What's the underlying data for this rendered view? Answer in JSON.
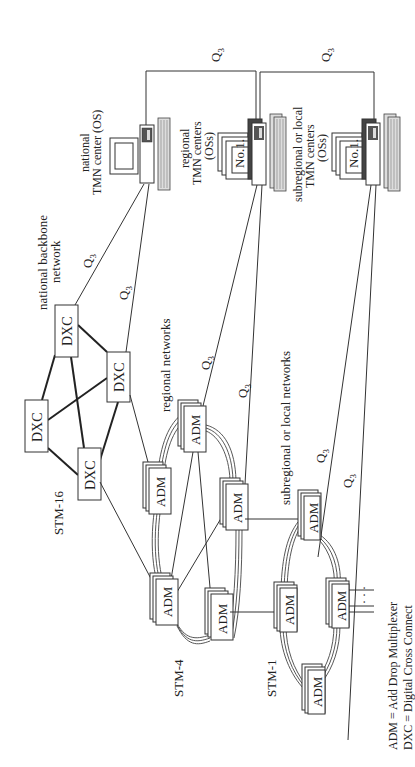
{
  "diagram": {
    "orientation": "rotated 90 degrees counter-clockwise",
    "management_link_label": "Q3",
    "q3_label_main": "Q",
    "q3_label_sub": "3",
    "tmn_centers": {
      "national": {
        "line1": "national",
        "line2": "TMN center (OS)"
      },
      "regional": {
        "line1": "regional",
        "line2": "TMN centers",
        "line3": "(OSs)",
        "screen_label": "No.1."
      },
      "subregional": {
        "line1": "subregional or local",
        "line2": "TMN centers",
        "line3": "(OSs)",
        "screen_label": "No.1."
      }
    },
    "network_labels": {
      "backbone_line1": "national backbone",
      "backbone_line2": "network",
      "regional": "regional networks",
      "subregional": "subregional or local networks"
    },
    "levels": {
      "stm16": "STM-16",
      "stm4": "STM-4",
      "stm1": "STM-1"
    },
    "nodes": {
      "dxc_label": "DXC",
      "adm_label": "ADM",
      "dxc_count": 4,
      "adm_regional_count": 4,
      "adm_local_count": 4
    },
    "ellipsis": "· · ·",
    "legend": {
      "adm": "ADM = Add Drop Multiplexer",
      "dxc": "DXC = Digital Cross Connect"
    }
  }
}
